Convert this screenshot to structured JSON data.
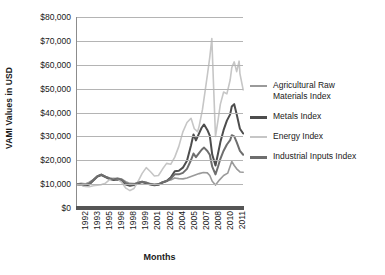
{
  "chart_data": {
    "type": "line",
    "title": "",
    "xlabel": "Months",
    "ylabel": "VAMI Values in USD",
    "ylim": [
      0,
      80000
    ],
    "ytick_labels": [
      "$0",
      "$10,000",
      "$20,000",
      "$30,000",
      "$40,000",
      "$50,000",
      "$60,000",
      "$70,000",
      "$80,000"
    ],
    "ytick_values": [
      0,
      10000,
      20000,
      30000,
      40000,
      50000,
      60000,
      70000,
      80000
    ],
    "xtick_labels": [
      "1992",
      "1993",
      "1995",
      "1996",
      "1998",
      "1999",
      "2001",
      "2002",
      "2004",
      "2005",
      "2007",
      "2008",
      "2010",
      "2011"
    ],
    "xlim": [
      1992,
      2012.5
    ],
    "grid": true,
    "legend_position": "right",
    "series": [
      {
        "name": "Agricultural Raw Materials Index",
        "legend_label": "Agricultural Raw\nMaterials Index",
        "color": "#9a9a9a",
        "width": 1.6,
        "x": [
          1992.0,
          1992.5,
          1993.0,
          1993.5,
          1994.0,
          1994.5,
          1995.0,
          1995.5,
          1996.0,
          1996.5,
          1997.0,
          1997.5,
          1998.0,
          1998.5,
          1999.0,
          1999.5,
          2000.0,
          2000.5,
          2001.0,
          2001.5,
          2002.0,
          2002.5,
          2003.0,
          2003.5,
          2004.0,
          2004.5,
          2005.0,
          2005.5,
          2006.0,
          2006.5,
          2007.0,
          2007.5,
          2008.0,
          2008.3,
          2008.6,
          2009.0,
          2009.5,
          2010.0,
          2010.5,
          2011.0,
          2011.3,
          2011.6,
          2012.0,
          2012.4
        ],
        "values": [
          10000,
          10300,
          10100,
          10800,
          11900,
          13300,
          14100,
          13200,
          12600,
          12200,
          12500,
          12100,
          11000,
          10300,
          10200,
          10700,
          11100,
          10800,
          10200,
          9900,
          10100,
          10900,
          11300,
          11700,
          12600,
          12300,
          12200,
          12600,
          13200,
          13800,
          14400,
          14900,
          14700,
          13600,
          11200,
          9600,
          11800,
          13600,
          14600,
          19500,
          17800,
          16400,
          15100,
          15000
        ]
      },
      {
        "name": "Metals Index",
        "legend_label": "Metals Index",
        "color": "#4d4d4d",
        "width": 2.0,
        "x": [
          1992.0,
          1992.5,
          1993.0,
          1993.5,
          1994.0,
          1994.5,
          1995.0,
          1995.5,
          1996.0,
          1996.5,
          1997.0,
          1997.5,
          1998.0,
          1998.5,
          1999.0,
          1999.5,
          2000.0,
          2000.5,
          2001.0,
          2001.5,
          2002.0,
          2002.5,
          2003.0,
          2003.5,
          2004.0,
          2004.5,
          2005.0,
          2005.5,
          2006.0,
          2006.3,
          2006.6,
          2007.0,
          2007.3,
          2007.6,
          2008.0,
          2008.3,
          2008.6,
          2009.0,
          2009.3,
          2009.6,
          2010.0,
          2010.4,
          2010.8,
          2011.0,
          2011.3,
          2011.6,
          2012.0,
          2012.4
        ],
        "values": [
          10000,
          9700,
          9300,
          9800,
          11500,
          13200,
          13800,
          12900,
          12100,
          11700,
          11900,
          11400,
          9800,
          9300,
          9600,
          10400,
          10900,
          10300,
          9800,
          9500,
          9700,
          10600,
          11300,
          12800,
          15400,
          15600,
          16900,
          19800,
          26300,
          30800,
          28300,
          31400,
          33600,
          35000,
          32700,
          30300,
          22400,
          17800,
          22600,
          27600,
          32700,
          36600,
          39200,
          42500,
          43500,
          39300,
          33200,
          31200
        ]
      },
      {
        "name": "Energy Index",
        "legend_label": "Energy Index",
        "color": "#c6c6c6",
        "width": 1.6,
        "x": [
          1992.0,
          1992.5,
          1993.0,
          1993.5,
          1994.0,
          1994.5,
          1995.0,
          1995.5,
          1996.0,
          1996.5,
          1997.0,
          1997.5,
          1998.0,
          1998.5,
          1999.0,
          1999.5,
          2000.0,
          2000.5,
          2001.0,
          2001.5,
          2002.0,
          2002.5,
          2003.0,
          2003.5,
          2004.0,
          2004.5,
          2005.0,
          2005.5,
          2006.0,
          2006.4,
          2006.8,
          2007.0,
          2007.4,
          2007.8,
          2008.0,
          2008.3,
          2008.55,
          2008.8,
          2009.0,
          2009.3,
          2009.6,
          2010.0,
          2010.4,
          2010.8,
          2011.0,
          2011.3,
          2011.6,
          2011.9,
          2012.0,
          2012.4
        ],
        "values": [
          10000,
          9600,
          9000,
          8900,
          9300,
          9500,
          9800,
          10400,
          11900,
          12600,
          12200,
          10700,
          8300,
          7300,
          8200,
          11200,
          14500,
          16900,
          15300,
          13400,
          13600,
          16300,
          18700,
          18300,
          21300,
          25800,
          31900,
          35800,
          37600,
          33200,
          32000,
          34400,
          41200,
          50700,
          55600,
          63200,
          71000,
          48000,
          30000,
          36500,
          43500,
          48600,
          47800,
          53600,
          58800,
          61200,
          57100,
          61500,
          56300,
          49500
        ]
      },
      {
        "name": "Industrial Inputs Index",
        "legend_label": "Industrial Inputs Index",
        "color": "#6e6e6e",
        "width": 2.0,
        "x": [
          1992.0,
          1992.5,
          1993.0,
          1993.5,
          1994.0,
          1994.5,
          1995.0,
          1995.5,
          1996.0,
          1996.5,
          1997.0,
          1997.5,
          1998.0,
          1998.5,
          1999.0,
          1999.5,
          2000.0,
          2000.5,
          2001.0,
          2001.5,
          2002.0,
          2002.5,
          2003.0,
          2003.5,
          2004.0,
          2004.5,
          2005.0,
          2005.5,
          2006.0,
          2006.3,
          2006.6,
          2007.0,
          2007.3,
          2007.6,
          2008.0,
          2008.3,
          2008.6,
          2009.0,
          2009.3,
          2009.6,
          2010.0,
          2010.4,
          2010.8,
          2011.0,
          2011.3,
          2011.6,
          2012.0,
          2012.4
        ],
        "values": [
          10000,
          9900,
          9600,
          10200,
          11700,
          13300,
          14000,
          13100,
          12400,
          12000,
          12300,
          11800,
          10400,
          9800,
          9900,
          10600,
          11000,
          10600,
          10000,
          9700,
          9900,
          10800,
          11300,
          12300,
          14100,
          14100,
          14700,
          16400,
          20100,
          22800,
          21300,
          23100,
          24400,
          25300,
          23900,
          22300,
          17300,
          14100,
          17200,
          20600,
          24000,
          26600,
          28400,
          30500,
          30000,
          27600,
          23900,
          22300
        ]
      }
    ]
  },
  "legend": {
    "entries": [
      {
        "label": "Agricultural Raw\nMaterials Index",
        "color": "#9a9a9a"
      },
      {
        "label": "Metals Index",
        "color": "#4d4d4d"
      },
      {
        "label": "Energy Index",
        "color": "#c6c6c6"
      },
      {
        "label": "Industrial Inputs Index",
        "color": "#6e6e6e"
      }
    ]
  }
}
